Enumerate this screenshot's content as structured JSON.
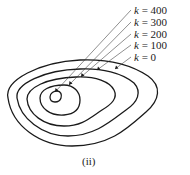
{
  "figure": {
    "caption": "(ii)",
    "labels": [
      {
        "var": "k",
        "eq": " = ",
        "value": "400"
      },
      {
        "var": "k",
        "eq": " = ",
        "value": "300"
      },
      {
        "var": "k",
        "eq": " = ",
        "value": "200"
      },
      {
        "var": "k",
        "eq": " = ",
        "value": "100"
      },
      {
        "var": "k",
        "eq": " = ",
        "value": "0"
      }
    ],
    "contours": [
      "k = 0",
      "k = 100",
      "k = 200",
      "k = 300",
      "k = 400"
    ],
    "stroke_color": "#1a1a1a"
  }
}
